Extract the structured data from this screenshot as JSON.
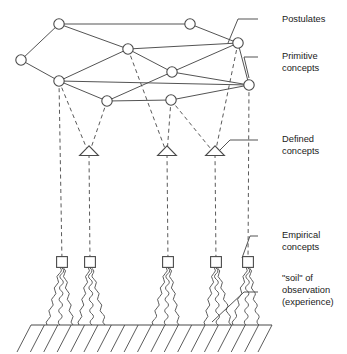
{
  "diagram": {
    "type": "concept-hierarchy-diagram",
    "colors": {
      "stroke": "#4a4a4a",
      "dashed": "#5a5a5a",
      "text": "#1a1a1a",
      "background": "#ffffff"
    },
    "labels": [
      {
        "id": "postulates",
        "lines": [
          "Postulates"
        ],
        "x": 282,
        "y": 22,
        "leader": [
          [
            258,
            19
          ],
          [
            238,
            19
          ],
          [
            228,
            43
          ]
        ]
      },
      {
        "id": "primitive",
        "lines": [
          "Primitive",
          "concepts"
        ],
        "x": 282,
        "y": 59,
        "leader": [
          [
            258,
            57
          ],
          [
            244,
            57
          ],
          [
            249,
            78
          ]
        ]
      },
      {
        "id": "defined",
        "lines": [
          "Defined",
          "concepts"
        ],
        "x": 282,
        "y": 142,
        "leader": [
          [
            258,
            140
          ],
          [
            230,
            140
          ],
          [
            220,
            150
          ]
        ]
      },
      {
        "id": "empirical",
        "lines": [
          "Empirical",
          "concepts"
        ],
        "x": 282,
        "y": 238,
        "leader": [
          [
            258,
            236
          ],
          [
            250,
            236
          ],
          [
            242,
            258
          ]
        ]
      },
      {
        "id": "soil",
        "lines": [
          "\"soil\" of",
          "observation",
          "(experience)"
        ],
        "x": 282,
        "y": 281,
        "leader": [
          [
            258,
            292
          ],
          [
            244,
            292
          ],
          [
            212,
            322
          ]
        ]
      }
    ],
    "nodes": {
      "postulates_primitive": [
        {
          "id": "n1",
          "x": 59,
          "y": 24
        },
        {
          "id": "n2",
          "x": 21,
          "y": 60
        },
        {
          "id": "n3",
          "x": 190,
          "y": 24
        },
        {
          "id": "n4",
          "x": 128,
          "y": 49
        },
        {
          "id": "n5",
          "x": 238,
          "y": 43
        },
        {
          "id": "n6",
          "x": 59,
          "y": 81
        },
        {
          "id": "n7",
          "x": 172,
          "y": 72
        },
        {
          "id": "n8",
          "x": 249,
          "y": 85
        },
        {
          "id": "n9",
          "x": 107,
          "y": 101
        },
        {
          "id": "n10",
          "x": 171,
          "y": 100
        }
      ],
      "defined": [
        {
          "id": "t1",
          "x": 89,
          "y": 154
        },
        {
          "id": "t2",
          "x": 167,
          "y": 154
        },
        {
          "id": "t3",
          "x": 215,
          "y": 154
        }
      ],
      "empirical": [
        {
          "id": "s1",
          "x": 62,
          "y": 262
        },
        {
          "id": "s2",
          "x": 90,
          "y": 262
        },
        {
          "id": "s3",
          "x": 168,
          "y": 262
        },
        {
          "id": "s4",
          "x": 216,
          "y": 262
        },
        {
          "id": "s5",
          "x": 248,
          "y": 262
        }
      ]
    },
    "solid_edges": [
      [
        "n2",
        "n1"
      ],
      [
        "n2",
        "n6"
      ],
      [
        "n1",
        "n3"
      ],
      [
        "n1",
        "n4"
      ],
      [
        "n6",
        "n4"
      ],
      [
        "n6",
        "n9"
      ],
      [
        "n4",
        "n7"
      ],
      [
        "n4",
        "n5"
      ],
      [
        "n3",
        "n5"
      ],
      [
        "n7",
        "n5"
      ],
      [
        "n7",
        "n8"
      ],
      [
        "n5",
        "n8"
      ],
      [
        "n9",
        "n7"
      ],
      [
        "n9",
        "n10"
      ],
      [
        "n10",
        "n8"
      ],
      [
        "n6",
        "n8"
      ]
    ],
    "dashed_edges": [
      [
        "n6",
        "t1"
      ],
      [
        "n9",
        "t1"
      ],
      [
        "n4",
        "t2"
      ],
      [
        "n10",
        "t2"
      ],
      [
        "n10",
        "t3"
      ],
      [
        "n5",
        "t3"
      ]
    ],
    "dashed_drops": [
      {
        "from": [
          59,
          81
        ],
        "to": [
          62,
          262
        ]
      },
      {
        "from": [
          89,
          154
        ],
        "to": [
          90,
          262
        ]
      },
      {
        "from": [
          167,
          154
        ],
        "to": [
          168,
          262
        ]
      },
      {
        "from": [
          215,
          154
        ],
        "to": [
          216,
          262
        ]
      },
      {
        "from": [
          249,
          85
        ],
        "to": [
          248,
          262
        ]
      }
    ],
    "ground": {
      "y": 325,
      "x_start": 31,
      "x_end": 272,
      "hatch_count": 19,
      "hatch_length": 27
    },
    "roots_per_square": 3
  }
}
